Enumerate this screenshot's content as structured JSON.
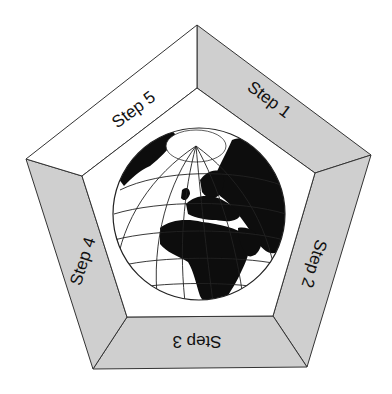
{
  "diagram": {
    "type": "cycle",
    "shape": "pentagon-frame",
    "center_image": "globe-icon",
    "center_description": "Orthographic globe centered on Europe and Africa with graticule lines and a white polar cap",
    "steps": [
      {
        "id": 1,
        "label": "Step 1",
        "position": "upper-right",
        "fill": "#cfcfcf"
      },
      {
        "id": 2,
        "label": "Step 2",
        "position": "right",
        "fill": "#cfcfcf"
      },
      {
        "id": 3,
        "label": "Step 3",
        "position": "bottom",
        "fill": "#cfcfcf"
      },
      {
        "id": 4,
        "label": "Step 4",
        "position": "left",
        "fill": "#cfcfcf"
      },
      {
        "id": 5,
        "label": "Step 5",
        "position": "upper-left",
        "fill": "#ffffff"
      }
    ]
  },
  "colors": {
    "background": "#ffffff",
    "shaded_band": "#cfcfcf",
    "light_band": "#ffffff",
    "outline": "#333333",
    "land": "#0d0d0d",
    "ocean": "#ffffff"
  }
}
